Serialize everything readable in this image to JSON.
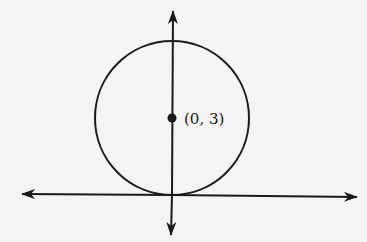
{
  "diagram": {
    "type": "circle-on-coordinate-axes",
    "center_label": "(0, 3)",
    "center": {
      "x": 0,
      "y": 3
    },
    "radius": 3,
    "tangent_to": "x-axis at origin",
    "colors": {
      "stroke": "#1a1a1a",
      "background": "#f4f4f2"
    }
  }
}
